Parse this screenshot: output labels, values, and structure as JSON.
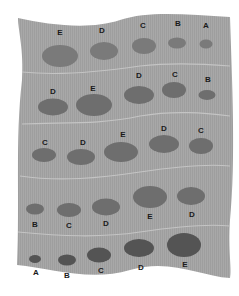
{
  "diagram": {
    "sheet_color": "#a6a6a6",
    "divider_color": "#c4c4c4",
    "rows": [
      {
        "spots": [
          {
            "label": "E",
            "cx": 60,
            "cy": 56,
            "rx": 18,
            "ry": 11,
            "color": "#7a7a7a"
          },
          {
            "label": "D",
            "cx": 104,
            "cy": 51,
            "rx": 14,
            "ry": 9,
            "color": "#7a7a7a"
          },
          {
            "label": "C",
            "cx": 144,
            "cy": 46,
            "rx": 12,
            "ry": 8,
            "color": "#7a7a7a"
          },
          {
            "label": "B",
            "cx": 177,
            "cy": 43,
            "rx": 9,
            "ry": 5.5,
            "color": "#7a7a7a"
          },
          {
            "label": "A",
            "cx": 206,
            "cy": 44,
            "rx": 6.5,
            "ry": 4.5,
            "color": "#7a7a7a"
          }
        ],
        "label_positions": [
          [
            60,
            35
          ],
          [
            102,
            33
          ],
          [
            143,
            28
          ],
          [
            178,
            26
          ],
          [
            206,
            28
          ]
        ]
      },
      {
        "spots": [
          {
            "label": "D",
            "cx": 53,
            "cy": 107,
            "rx": 15,
            "ry": 8.5,
            "color": "#6e6e6e"
          },
          {
            "label": "E",
            "cx": 94,
            "cy": 105,
            "rx": 18,
            "ry": 11,
            "color": "#6e6e6e"
          },
          {
            "label": "D",
            "cx": 139,
            "cy": 95,
            "rx": 15,
            "ry": 9,
            "color": "#6e6e6e"
          },
          {
            "label": "C",
            "cx": 174,
            "cy": 90,
            "rx": 12,
            "ry": 8,
            "color": "#6e6e6e"
          },
          {
            "label": "B",
            "cx": 207,
            "cy": 95,
            "rx": 8.5,
            "ry": 5,
            "color": "#6e6e6e"
          }
        ],
        "label_positions": [
          [
            53,
            94
          ],
          [
            93,
            91
          ],
          [
            139,
            78
          ],
          [
            175,
            77
          ],
          [
            208,
            82
          ]
        ]
      },
      {
        "spots": [
          {
            "label": "C",
            "cx": 44,
            "cy": 155,
            "rx": 12,
            "ry": 7,
            "color": "#6e6e6e"
          },
          {
            "label": "D",
            "cx": 81,
            "cy": 157,
            "rx": 14,
            "ry": 8,
            "color": "#6e6e6e"
          },
          {
            "label": "E",
            "cx": 121,
            "cy": 152,
            "rx": 17,
            "ry": 10,
            "color": "#6e6e6e"
          },
          {
            "label": "D",
            "cx": 164,
            "cy": 144,
            "rx": 15,
            "ry": 9,
            "color": "#6e6e6e"
          },
          {
            "label": "C",
            "cx": 201,
            "cy": 146,
            "rx": 12,
            "ry": 8,
            "color": "#6e6e6e"
          }
        ],
        "label_positions": [
          [
            45,
            145
          ],
          [
            83,
            145
          ],
          [
            123,
            137
          ],
          [
            164,
            131
          ],
          [
            201,
            133
          ]
        ]
      },
      {
        "spots": [
          {
            "label": "B",
            "cx": 35,
            "cy": 209,
            "rx": 9,
            "ry": 5.5,
            "color": "#6e6e6e"
          },
          {
            "label": "C",
            "cx": 69,
            "cy": 210,
            "rx": 12,
            "ry": 7,
            "color": "#6e6e6e"
          },
          {
            "label": "D",
            "cx": 106,
            "cy": 207,
            "rx": 14,
            "ry": 8.5,
            "color": "#6e6e6e"
          },
          {
            "label": "E",
            "cx": 150,
            "cy": 197,
            "rx": 17,
            "ry": 11,
            "color": "#6e6e6e"
          },
          {
            "label": "D",
            "cx": 191,
            "cy": 196,
            "rx": 14,
            "ry": 9,
            "color": "#6e6e6e"
          }
        ],
        "label_positions": [
          [
            35,
            227
          ],
          [
            69,
            228
          ],
          [
            106,
            226
          ],
          [
            150,
            219
          ],
          [
            192,
            217
          ]
        ]
      },
      {
        "spots": [
          {
            "label": "A",
            "cx": 35,
            "cy": 259,
            "rx": 6,
            "ry": 4,
            "color": "#545454"
          },
          {
            "label": "B",
            "cx": 67,
            "cy": 260,
            "rx": 9,
            "ry": 5.5,
            "color": "#545454"
          },
          {
            "label": "C",
            "cx": 99,
            "cy": 255,
            "rx": 12,
            "ry": 7.5,
            "color": "#545454"
          },
          {
            "label": "D",
            "cx": 139,
            "cy": 248,
            "rx": 15,
            "ry": 9,
            "color": "#545454"
          },
          {
            "label": "E",
            "cx": 184,
            "cy": 245,
            "rx": 17,
            "ry": 12,
            "color": "#545454"
          }
        ],
        "label_positions": [
          [
            36,
            275
          ],
          [
            67,
            278
          ],
          [
            101,
            273
          ],
          [
            141,
            270
          ],
          [
            185,
            267
          ]
        ]
      }
    ]
  }
}
